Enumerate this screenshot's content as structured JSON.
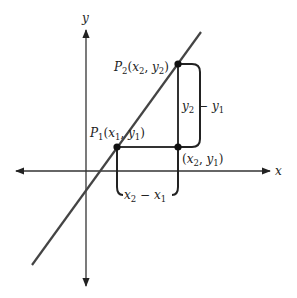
{
  "diagram": {
    "axes": {
      "x_label": "x",
      "y_label": "y"
    },
    "points": {
      "p1": {
        "name": "P",
        "sub": "1",
        "coords_open": "(",
        "x": "x",
        "xsub": "1",
        "sep": ", ",
        "y": "y",
        "ysub": "1",
        "coords_close": ")"
      },
      "p2": {
        "name": "P",
        "sub": "2",
        "coords_open": "(",
        "x": "x",
        "xsub": "2",
        "sep": ", ",
        "y": "y",
        "ysub": "2",
        "coords_close": ")"
      },
      "corner": {
        "coords_open": "(",
        "x": "x",
        "xsub": "2",
        "sep": ", ",
        "y": "y",
        "ysub": "1",
        "coords_close": ")"
      }
    },
    "brackets": {
      "rise": {
        "a": "y",
        "asub": "2",
        "op": " − ",
        "b": "y",
        "bsub": "1"
      },
      "run": {
        "a": "x",
        "asub": "2",
        "op": " − ",
        "b": "x",
        "bsub": "1"
      }
    },
    "colors": {
      "line": "#444444",
      "axis": "#333333",
      "point": "#111111"
    }
  }
}
